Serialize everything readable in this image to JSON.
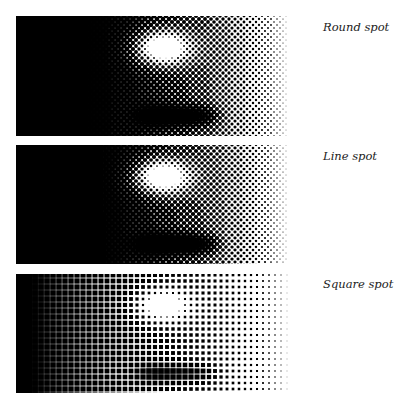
{
  "figure": {
    "panels": [
      {
        "label": "Round spot",
        "type": "round",
        "top": 16,
        "height": 120,
        "label_top": 20
      },
      {
        "label": "Line spot",
        "type": "line",
        "top": 145,
        "height": 119,
        "label_top": 149
      },
      {
        "label": "Square spot",
        "type": "square",
        "top": 274,
        "height": 119,
        "label_top": 277
      }
    ],
    "colors": {
      "ink": "#000000",
      "paper": "#ffffff"
    }
  }
}
